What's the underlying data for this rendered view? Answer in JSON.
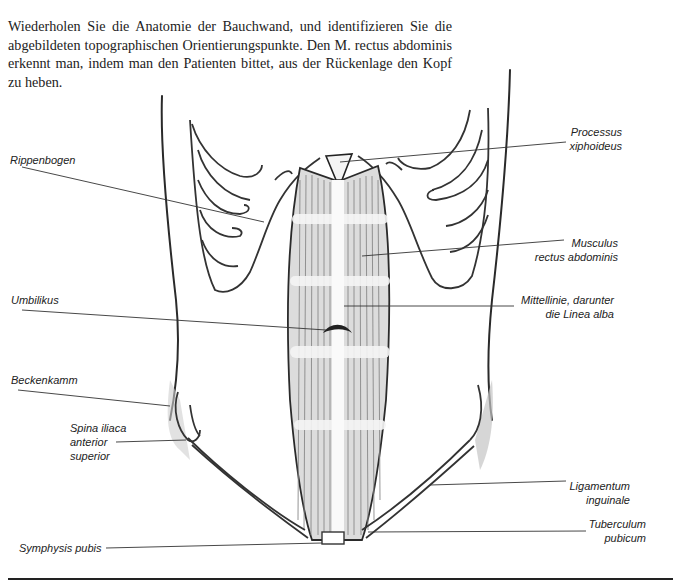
{
  "intro_text": "Wiederholen Sie die Anatomie der Bauchwand, und identifizieren Sie die abgebildeten topographischen Orientierungspunkte. Den M. rectus abdominis erkennt man, indem man den Patienten bittet, aus der Rückenlage den Kopf zu heben.",
  "figure": {
    "labels_left": {
      "rippenbogen": "Rippenbogen",
      "umbilikus": "Umbilikus",
      "beckenkamm": "Beckenkamm",
      "spina_1": "Spina iliaca",
      "spina_2": "anterior",
      "spina_3": "superior",
      "symphysis": "Symphysis pubis"
    },
    "labels_right": {
      "processus_1": "Processus",
      "processus_2": "xiphoideus",
      "musculus_1": "Musculus",
      "musculus_2": "rectus abdominis",
      "mittellinie_1": "Mittellinie, darunter",
      "mittellinie_2": "die Linea alba",
      "ligamentum_1": "Ligamentum",
      "ligamentum_2": "inguinale",
      "tuberculum_1": "Tuberculum",
      "tuberculum_2": "pubicum"
    }
  },
  "colors": {
    "ink": "#222222",
    "shade": "#9a9a9a",
    "background": "#ffffff"
  }
}
